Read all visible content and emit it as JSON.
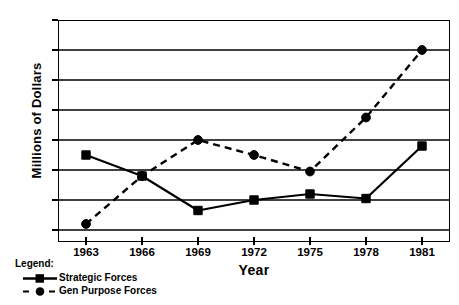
{
  "chart_data": {
    "type": "line",
    "title": "",
    "xlabel": "Year",
    "ylabel": "Millions of Dollars",
    "categories": [
      "1963",
      "1966",
      "1969",
      "1972",
      "1975",
      "1978",
      "1981"
    ],
    "x": [
      1963,
      1966,
      1969,
      1972,
      1975,
      1978,
      1981
    ],
    "xlim": [
      1961.5,
      1982.5
    ],
    "ylim": [
      1.2,
      16
    ],
    "yticks": [
      2,
      4,
      6,
      8,
      10,
      12,
      14,
      16
    ],
    "ytick_labels": [
      "2",
      "4",
      "6",
      "8",
      "10",
      "12",
      "14",
      "16"
    ],
    "grid": "horizontal",
    "legend_position": "below-left",
    "legend_title": "Legend:",
    "series": [
      {
        "name": "Strategic Forces",
        "values": [
          7.0,
          5.6,
          3.3,
          4.0,
          4.4,
          4.1,
          7.6
        ],
        "line_style": "solid",
        "marker": "square",
        "color": "#000000"
      },
      {
        "name": "Gen Purpose Forces",
        "values": [
          2.4,
          5.6,
          8.0,
          7.0,
          5.9,
          9.5,
          14.0
        ],
        "line_style": "dashed",
        "marker": "circle",
        "color": "#000000"
      }
    ]
  }
}
